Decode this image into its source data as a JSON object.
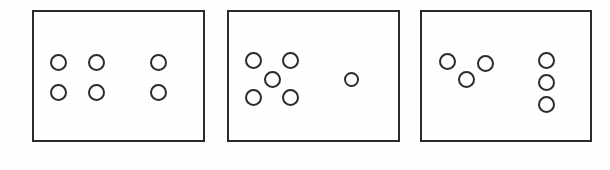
{
  "figure": {
    "canvas": {
      "width": 610,
      "height": 170
    },
    "background_color": "#ffffff",
    "stroke_color": "#2b2b2b",
    "circle_fill_color": "#ffffff",
    "panel_border_color": "#2b2b2b",
    "panel_border_width": 2,
    "circle_stroke_width": 2.6
  },
  "panels": [
    {
      "id": "panel-1",
      "label": "Panel 1",
      "frame": {
        "x": 32,
        "y": 10,
        "width": 173,
        "height": 132
      },
      "total_circles": 6,
      "groups": [
        {
          "id": "panel-1-group-left",
          "label": "Left group",
          "arrangement": "2x2-grid",
          "count": 4,
          "circles": [
            {
              "cx": 58,
              "cy": 62,
              "r": 8.5
            },
            {
              "cx": 96,
              "cy": 62,
              "r": 8.5
            },
            {
              "cx": 58,
              "cy": 92,
              "r": 8.5
            },
            {
              "cx": 96,
              "cy": 92,
              "r": 8.5
            }
          ]
        },
        {
          "id": "panel-1-group-right",
          "label": "Right group",
          "arrangement": "vertical-pair",
          "count": 2,
          "circles": [
            {
              "cx": 158,
              "cy": 62,
              "r": 8.5
            },
            {
              "cx": 158,
              "cy": 92,
              "r": 8.5
            }
          ]
        }
      ]
    },
    {
      "id": "panel-2",
      "label": "Panel 2",
      "frame": {
        "x": 227,
        "y": 10,
        "width": 173,
        "height": 132
      },
      "total_circles": 6,
      "groups": [
        {
          "id": "panel-2-group-left",
          "label": "Left group",
          "arrangement": "quincunx",
          "count": 5,
          "circles": [
            {
              "cx": 253,
              "cy": 60,
              "r": 8.5
            },
            {
              "cx": 290,
              "cy": 60,
              "r": 8.5
            },
            {
              "cx": 272,
              "cy": 79,
              "r": 8.5
            },
            {
              "cx": 253,
              "cy": 97,
              "r": 8.5
            },
            {
              "cx": 290,
              "cy": 97,
              "r": 8.5
            }
          ]
        },
        {
          "id": "panel-2-group-right",
          "label": "Right group",
          "arrangement": "single",
          "count": 1,
          "circles": [
            {
              "cx": 351,
              "cy": 79,
              "r": 7.5
            }
          ]
        }
      ]
    },
    {
      "id": "panel-3",
      "label": "Panel 3",
      "frame": {
        "x": 420,
        "y": 10,
        "width": 172,
        "height": 132
      },
      "total_circles": 6,
      "groups": [
        {
          "id": "panel-3-group-left",
          "label": "Left group",
          "arrangement": "triangle",
          "count": 3,
          "circles": [
            {
              "cx": 447,
              "cy": 61,
              "r": 8.5
            },
            {
              "cx": 485,
              "cy": 63,
              "r": 8.5
            },
            {
              "cx": 466,
              "cy": 79,
              "r": 8.5
            }
          ]
        },
        {
          "id": "panel-3-group-right",
          "label": "Right group",
          "arrangement": "vertical-column",
          "count": 3,
          "circles": [
            {
              "cx": 546,
              "cy": 60,
              "r": 8.5
            },
            {
              "cx": 546,
              "cy": 82,
              "r": 8.5
            },
            {
              "cx": 546,
              "cy": 104,
              "r": 8.5
            }
          ]
        }
      ]
    }
  ]
}
